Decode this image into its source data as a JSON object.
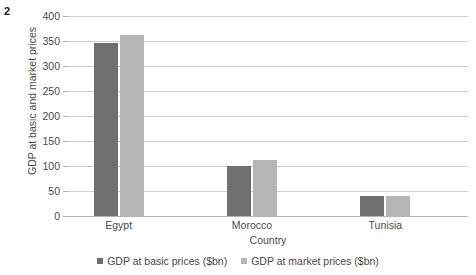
{
  "figure_number": "2",
  "chart_data": {
    "type": "bar",
    "title": "",
    "xlabel": "Country",
    "ylabel": "GDP at basic and market prices",
    "categories": [
      "Egypt",
      "Morocco",
      "Tunisia"
    ],
    "series": [
      {
        "name": "GDP at basic prices ($bn)",
        "color": "#6f6f6f",
        "values": [
          347,
          100,
          40
        ]
      },
      {
        "name": "GDP at market prices ($bn)",
        "color": "#b5b5b5",
        "values": [
          363,
          112,
          41
        ]
      }
    ],
    "ylim": [
      0,
      400
    ],
    "yticks": [
      0,
      50,
      100,
      150,
      200,
      250,
      300,
      350,
      400
    ],
    "ytick_labels": [
      "0",
      "50",
      "100",
      "150",
      "200",
      "250",
      "300",
      "350",
      "400"
    ],
    "grid": true,
    "grid_axis": "y",
    "legend_position": "bottom"
  }
}
